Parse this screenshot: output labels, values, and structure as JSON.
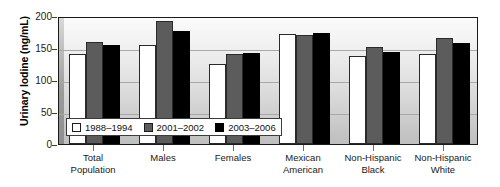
{
  "chart_data": {
    "type": "bar",
    "title": "",
    "xlabel": "",
    "ylabel": "Urinary Iodine (ng/mL)",
    "ylim": [
      0,
      200
    ],
    "yticks": [
      0,
      50,
      100,
      150,
      200
    ],
    "grid": true,
    "legend_position": "inside-bottom-left",
    "categories": [
      "Total Population",
      "Males",
      "Females",
      "Mexican American",
      "Non-Hispanic Black",
      "Non-Hispanic White"
    ],
    "category_lines": [
      [
        "Total",
        "Population"
      ],
      [
        "Males",
        ""
      ],
      [
        "Females",
        ""
      ],
      [
        "Mexican",
        "American"
      ],
      [
        "Non-Hispanic",
        "Black"
      ],
      [
        "Non-Hispanic",
        "White"
      ]
    ],
    "series": [
      {
        "name": "1988–1994",
        "color": "#ffffff",
        "values": [
          140,
          155,
          125,
          172,
          138,
          140
        ]
      },
      {
        "name": "2001–2002",
        "color": "#5c5c5c",
        "values": [
          160,
          192,
          140,
          170,
          152,
          165
        ]
      },
      {
        "name": "2003–2006",
        "color": "#000000",
        "values": [
          155,
          176,
          142,
          173,
          143,
          158
        ]
      }
    ]
  }
}
